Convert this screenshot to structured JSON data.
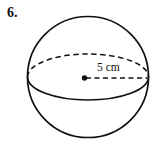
{
  "page": {
    "background_color": "#ffffff",
    "ink_color": "#111111",
    "width": 155,
    "height": 147
  },
  "problem": {
    "number_label": "6."
  },
  "figure": {
    "name": "sphere-diagram",
    "shape": "sphere",
    "outline_color": "#111111",
    "stroke_width": 1.6,
    "sphere": {
      "center_x": 88,
      "center_y": 77,
      "radius": 60.5
    },
    "equator": {
      "center_x": 88,
      "center_y": 77,
      "rx": 60.5,
      "ry": 23,
      "back_half_style": "dashed",
      "front_half_style": "solid"
    },
    "center_point": {
      "x": 85,
      "y": 78,
      "radius": 2.6,
      "style": "filled-dot"
    },
    "radius_line": {
      "from_x": 85,
      "from_y": 78,
      "to_x": 147,
      "to_y": 78,
      "style": "dashed",
      "label": "5 cm",
      "label_x": 97,
      "label_y": 70
    }
  },
  "measurements": {
    "radius_value": "5",
    "radius_unit": "cm",
    "radius_text": "5 cm"
  }
}
